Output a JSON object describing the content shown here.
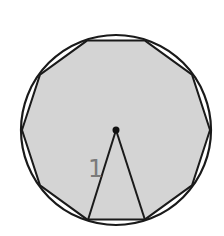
{
  "figure": {
    "circle": {
      "cx": 116,
      "cy": 130,
      "r": 95,
      "stroke": "#1a1a1a"
    },
    "polygon": {
      "sides": 10,
      "points": "145,40.6 192,74.7 210,130 192,185.3 145,219.4 87,219.4 40,185.3 22,130 40,74.7 87,40.6",
      "fill": "#d4d4d4",
      "stroke": "#1a1a1a"
    },
    "center_point": {
      "cx": 116,
      "cy": 130,
      "r": 3.5
    },
    "triangle": {
      "apex": [
        116,
        130
      ],
      "left": [
        88,
        220
      ],
      "right": [
        145,
        220
      ]
    },
    "radius_label": {
      "text": "1",
      "x": 88,
      "y": 177,
      "color": "#7a7a7a"
    }
  }
}
